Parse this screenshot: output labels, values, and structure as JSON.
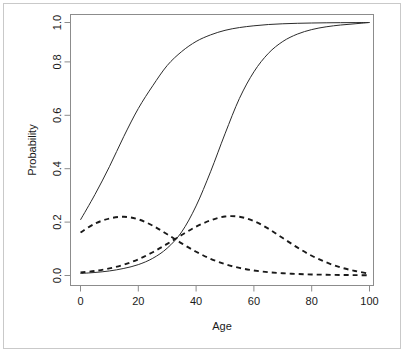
{
  "figure": {
    "name": "probability-vs-age-plot",
    "background_color": "#ffffff",
    "frame_color": "#c9c9c9",
    "axis_color": "#8c8c8c",
    "curve_color": "#2b2b2b"
  },
  "chart_data": {
    "type": "line",
    "title": "",
    "subtitle": "",
    "xlabel": "Age",
    "ylabel": "Probability",
    "xlim": [
      0,
      100
    ],
    "ylim": [
      0.0,
      1.0
    ],
    "xticks": [
      0,
      20,
      40,
      60,
      80,
      100
    ],
    "xtick_labels": [
      "0",
      "20",
      "40",
      "60",
      "80",
      "100"
    ],
    "yticks": [
      0.0,
      0.2,
      0.4,
      0.6,
      0.8,
      1.0
    ],
    "ytick_labels": [
      "0.0",
      "0.2",
      "0.4",
      "0.6",
      "0.8",
      "1.0"
    ],
    "grid": false,
    "legend": null,
    "legend_position": "none",
    "annotations": [],
    "x": [
      0,
      5,
      10,
      15,
      20,
      25,
      30,
      35,
      40,
      45,
      50,
      55,
      60,
      65,
      70,
      75,
      80,
      85,
      90,
      95,
      100
    ],
    "series": [
      {
        "name": "cumulative-early",
        "style": "solid",
        "linestyle": "solid",
        "color": "#2b2b2b",
        "description": "Logistic cumulative probability curve with early inflection (around age 18)",
        "values": [
          0.22,
          0.32,
          0.43,
          0.55,
          0.66,
          0.75,
          0.83,
          0.885,
          0.925,
          0.951,
          0.969,
          0.98,
          0.987,
          0.992,
          0.995,
          0.9968,
          0.998,
          0.9988,
          0.9993,
          0.9996,
          1.0
        ]
      },
      {
        "name": "cumulative-late",
        "style": "solid",
        "linestyle": "solid",
        "color": "#2b2b2b",
        "description": "Logistic cumulative probability curve with late inflection (around age 45)",
        "values": [
          0.008,
          0.012,
          0.018,
          0.028,
          0.043,
          0.068,
          0.108,
          0.172,
          0.275,
          0.41,
          0.56,
          0.7,
          0.805,
          0.878,
          0.925,
          0.954,
          0.972,
          0.983,
          0.99,
          0.995,
          1.0
        ]
      },
      {
        "name": "density-early",
        "style": "dashed",
        "linestyle": "dashed",
        "color": "#1a1a1a",
        "description": "Dashed density curve peaking near age 14 at about 0.23",
        "values": [
          0.17,
          0.205,
          0.225,
          0.232,
          0.222,
          0.197,
          0.163,
          0.127,
          0.094,
          0.066,
          0.045,
          0.03,
          0.02,
          0.013,
          0.009,
          0.006,
          0.004,
          0.003,
          0.002,
          0.0015,
          0.001
        ]
      },
      {
        "name": "density-late",
        "style": "dashed",
        "linestyle": "dashed",
        "color": "#1a1a1a",
        "description": "Dashed density curve peaking near age 48 at about 0.235",
        "values": [
          0.012,
          0.018,
          0.028,
          0.043,
          0.064,
          0.092,
          0.125,
          0.16,
          0.193,
          0.218,
          0.233,
          0.232,
          0.215,
          0.185,
          0.148,
          0.111,
          0.078,
          0.052,
          0.032,
          0.018,
          0.007
        ]
      }
    ]
  }
}
